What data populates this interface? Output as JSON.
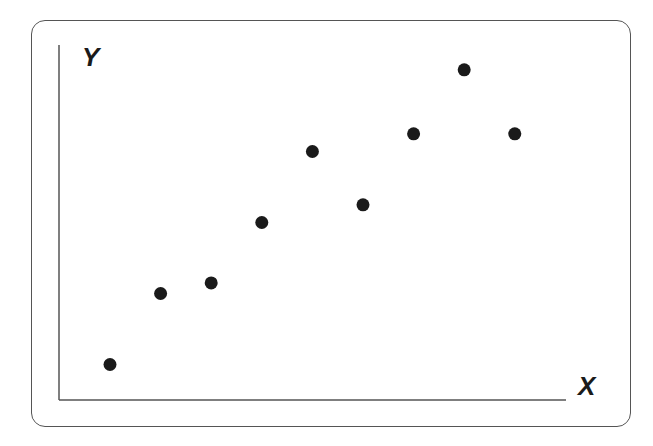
{
  "chart_data": {
    "type": "scatter",
    "title": "",
    "xlabel": "X",
    "ylabel": "Y",
    "grid": false,
    "legend": null,
    "ticks": false,
    "xlim": [
      0,
      10
    ],
    "ylim": [
      0,
      10
    ],
    "points": [
      {
        "x": 1,
        "y": 1.0
      },
      {
        "x": 2,
        "y": 3.0
      },
      {
        "x": 3,
        "y": 3.3
      },
      {
        "x": 4,
        "y": 5.0
      },
      {
        "x": 5,
        "y": 7.0
      },
      {
        "x": 6,
        "y": 5.5
      },
      {
        "x": 7,
        "y": 7.5
      },
      {
        "x": 8,
        "y": 9.3
      },
      {
        "x": 9,
        "y": 7.5
      }
    ],
    "colors": {
      "points": "#1a1a1a",
      "axes": "#555555",
      "frame": "#555555"
    }
  },
  "labels": {
    "x_axis": "X",
    "y_axis": "Y"
  }
}
